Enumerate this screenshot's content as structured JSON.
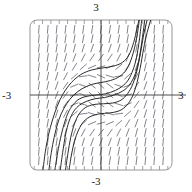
{
  "figure": {
    "kind": "slope-field-plot",
    "background": "#ffffff",
    "frame": {
      "x": 30,
      "y": 20,
      "width": 142,
      "height": 150,
      "corner_radius": 7,
      "stroke": "#8a8a8a",
      "stroke_width": 0.9
    },
    "axes": {
      "origin_px": {
        "x": 101,
        "y": 95
      },
      "stroke": "#3a3a3a",
      "stroke_width": 0.9,
      "x_axis": {
        "from_px": 30,
        "to_px": 186,
        "y_px": 95
      },
      "y_axis": {
        "from_px": 20,
        "to_px": 170,
        "x_px": 101
      }
    },
    "ticks": {
      "count_top": 17,
      "count_bottom": 17,
      "length_px": 4,
      "stroke": "#8a8a8a",
      "stroke_width": 0.8
    },
    "labels": {
      "top": "3",
      "bottom": "-3",
      "left": "-3",
      "right": "3"
    },
    "slope_field": {
      "color": "#6e6e78",
      "stroke_width": 0.85,
      "segment_length_px": 8,
      "columns": 17,
      "rows": 17
    },
    "solution_curves": {
      "color": "#2a2a2a",
      "stroke_width": 1.0,
      "count": 6
    }
  },
  "chart_data": {
    "type": "line",
    "title": "",
    "subtitle": "",
    "xlabel": "",
    "ylabel": "",
    "xlim": [
      -3,
      3
    ],
    "ylim": [
      -3,
      3
    ],
    "grid": false,
    "legend": null,
    "x_ticklabels": [
      "-3",
      "3"
    ],
    "y_ticklabels": [
      "-3",
      "3"
    ],
    "annotations": [
      {
        "text": "3",
        "position": "top",
        "value": 3
      },
      {
        "text": "-3",
        "position": "bottom",
        "value": -3
      },
      {
        "text": "-3",
        "position": "left",
        "value": -3
      },
      {
        "text": "3",
        "position": "right",
        "value": 3
      }
    ],
    "field": {
      "description": "direction field of a first-order ODE; slopes are steep (near vertical) far from the origin and flatten to near horizontal close to the origin",
      "slope_formula": "dy/dx = x^2 + y^2 - 1",
      "sample_x": [
        -3,
        -2.625,
        -2.25,
        -1.875,
        -1.5,
        -1.125,
        -0.75,
        -0.375,
        0,
        0.375,
        0.75,
        1.125,
        1.5,
        1.875,
        2.25,
        2.625,
        3
      ],
      "sample_y": [
        -3,
        -2.625,
        -2.25,
        -1.875,
        -1.5,
        -1.125,
        -0.75,
        -0.375,
        0,
        0.375,
        0.75,
        1.125,
        1.5,
        1.875,
        2.25,
        2.625,
        3
      ]
    },
    "series": [
      {
        "name": "solution-1",
        "x": [
          -1.95,
          -1.85,
          -1.75,
          -1.6,
          -1.45,
          -1.3,
          -1.1,
          -0.9,
          -0.6,
          -0.2,
          0.2,
          0.6,
          0.9,
          1.15,
          1.35,
          1.5,
          1.62,
          1.72
        ],
        "y": [
          -3.0,
          -2.4,
          -1.9,
          -1.3,
          -0.85,
          -0.55,
          -0.3,
          -0.15,
          -0.05,
          0.0,
          0.05,
          0.18,
          0.35,
          0.6,
          1.0,
          1.5,
          2.2,
          3.0
        ]
      },
      {
        "name": "solution-2",
        "x": [
          -1.72,
          -1.62,
          -1.5,
          -1.35,
          -1.15,
          -0.9,
          -0.6,
          -0.25,
          0.15,
          0.55,
          0.9,
          1.2,
          1.45,
          1.62,
          1.75,
          1.85
        ],
        "y": [
          -3.0,
          -2.3,
          -1.6,
          -1.05,
          -0.65,
          -0.4,
          -0.25,
          -0.15,
          -0.1,
          0.0,
          0.15,
          0.4,
          0.85,
          1.5,
          2.3,
          3.0
        ]
      },
      {
        "name": "solution-3",
        "x": [
          -1.5,
          -1.4,
          -1.28,
          -1.12,
          -0.92,
          -0.65,
          -0.3,
          0.1,
          0.5,
          0.85,
          1.12,
          1.35,
          1.55,
          1.7,
          1.82,
          1.95
        ],
        "y": [
          -3.0,
          -2.35,
          -1.7,
          -1.15,
          -0.75,
          -0.5,
          -0.38,
          -0.35,
          -0.32,
          -0.2,
          0.05,
          0.45,
          1.1,
          1.85,
          2.5,
          3.0
        ]
      },
      {
        "name": "solution-4",
        "x": [
          -2.2,
          -2.1,
          -1.98,
          -1.85,
          -1.68,
          -1.45,
          -1.15,
          -0.8,
          -0.4,
          0.0,
          0.4,
          0.8,
          1.1,
          1.32,
          1.5,
          1.62
        ],
        "y": [
          -3.0,
          -2.3,
          -1.7,
          -1.2,
          -0.75,
          -0.35,
          0.0,
          0.25,
          0.42,
          0.5,
          0.58,
          0.75,
          1.05,
          1.55,
          2.25,
          3.0
        ]
      },
      {
        "name": "solution-5",
        "x": [
          -2.45,
          -2.35,
          -2.22,
          -2.05,
          -1.85,
          -1.6,
          -1.25,
          -0.85,
          -0.4,
          0.05,
          0.5,
          0.9,
          1.18,
          1.38,
          1.52,
          1.6
        ],
        "y": [
          -3.0,
          -2.25,
          -1.6,
          -1.0,
          -0.45,
          0.05,
          0.5,
          0.82,
          1.0,
          1.08,
          1.15,
          1.3,
          1.6,
          2.1,
          2.65,
          3.0
        ]
      },
      {
        "name": "solution-6",
        "x": [
          -1.35,
          -1.25,
          -1.12,
          -0.95,
          -0.72,
          -0.42,
          -0.05,
          0.35,
          0.72,
          1.02,
          1.28,
          1.48,
          1.65,
          1.8,
          1.95,
          2.1
        ],
        "y": [
          -3.0,
          -2.4,
          -1.85,
          -1.4,
          -1.05,
          -0.85,
          -0.75,
          -0.72,
          -0.65,
          -0.48,
          -0.15,
          0.35,
          1.05,
          1.85,
          2.5,
          3.0
        ]
      }
    ]
  }
}
